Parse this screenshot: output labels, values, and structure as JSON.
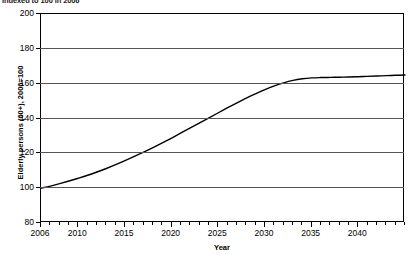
{
  "caption": "Indexed to 100 in 2006",
  "axis_title_label": "Year",
  "chart_data": {
    "type": "line",
    "title": "Indexed to 100 in 2006",
    "xlabel": "Year",
    "ylabel": "Elderly persons (60+), 2006=100",
    "xlim": [
      2006,
      2045
    ],
    "ylim": [
      80,
      200
    ],
    "grid": "horizontal",
    "legend": "none",
    "ytick_labels": [
      "80",
      "100",
      "120",
      "140",
      "160",
      "180",
      "200"
    ],
    "ytick_values": [
      80,
      100,
      120,
      140,
      160,
      180,
      200
    ],
    "xtick_labels": [
      "2006",
      "2010",
      "2015",
      "2020",
      "2025",
      "2030",
      "2035",
      "2040"
    ],
    "xtick_values": [
      2006,
      2010,
      2015,
      2020,
      2025,
      2030,
      2035,
      2040
    ],
    "xminor_step": 1,
    "series": [
      {
        "name": "Elderly persons (60+), 2006=100",
        "color": "#000000",
        "x": [
          2006,
          2007,
          2008,
          2009,
          2010,
          2011,
          2012,
          2013,
          2014,
          2015,
          2016,
          2017,
          2018,
          2019,
          2020,
          2021,
          2022,
          2023,
          2024,
          2025,
          2026,
          2027,
          2028,
          2029,
          2030,
          2031,
          2032,
          2033,
          2034,
          2035,
          2036,
          2037,
          2038,
          2039,
          2040,
          2041,
          2042,
          2043,
          2044,
          2045
        ],
        "values": [
          100.0,
          101.2,
          102.6,
          104.1,
          105.7,
          107.4,
          109.3,
          111.3,
          113.5,
          115.8,
          118.2,
          120.7,
          123.3,
          126.0,
          128.8,
          131.7,
          134.6,
          137.5,
          140.4,
          143.3,
          146.2,
          149.0,
          151.7,
          154.2,
          156.6,
          158.7,
          160.5,
          161.9,
          162.8,
          163.3,
          163.5,
          163.6,
          163.7,
          163.8,
          164.0,
          164.2,
          164.4,
          164.6,
          164.8,
          165.0
        ]
      }
    ],
    "annotations": [
      {
        "label": "start value",
        "x": 2006,
        "y": 100
      },
      {
        "label": "crosses 120",
        "x": 2018,
        "y": 120
      },
      {
        "label": "crosses 140",
        "x": 2024,
        "y": 140
      },
      {
        "label": "crosses 160",
        "x": 2031,
        "y": 160
      },
      {
        "label": "plateau",
        "x": 2045,
        "y": 165
      }
    ]
  }
}
